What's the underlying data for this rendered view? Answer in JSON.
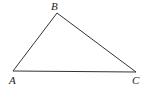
{
  "diagram": {
    "type": "triangle",
    "vertices": [
      {
        "id": "A",
        "label": "A",
        "x": 13,
        "y": 71,
        "label_x": 9,
        "label_y": 84
      },
      {
        "id": "B",
        "label": "B",
        "x": 57,
        "y": 13,
        "label_x": 51,
        "label_y": 10
      },
      {
        "id": "C",
        "label": "C",
        "x": 136,
        "y": 72,
        "label_x": 132,
        "label_y": 84
      }
    ],
    "edges": [
      {
        "from": "A",
        "to": "B"
      },
      {
        "from": "B",
        "to": "C"
      },
      {
        "from": "A",
        "to": "C"
      }
    ],
    "colors": {
      "stroke": "#333333",
      "label": "#222222",
      "background": "#ffffff"
    }
  }
}
